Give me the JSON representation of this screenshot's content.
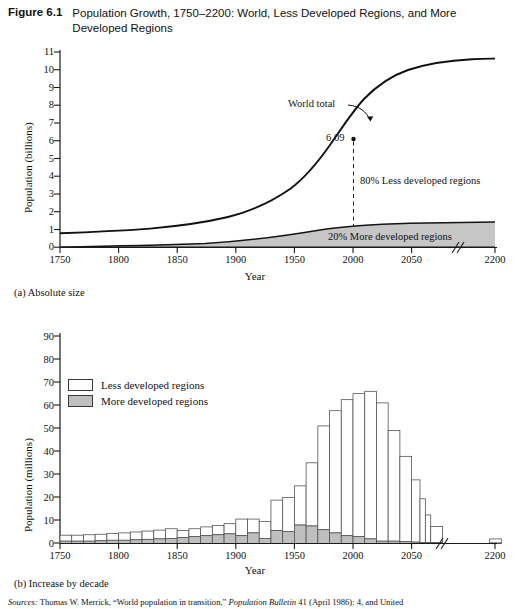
{
  "figure": {
    "number": "Figure 6.1",
    "title": "Population Growth, 1750–2200: World, Less Developed Regions, and More Developed Regions"
  },
  "panel_a": {
    "caption": "(a) Absolute size",
    "ylabel": "Population (billions)",
    "xlabel": "Year",
    "annotations": {
      "world_total": "World total",
      "value_label": "6.09",
      "less_developed": "80% Less developed regions",
      "more_developed": "20% More developed regions"
    }
  },
  "panel_b": {
    "caption": "(b) Increase by decade",
    "ylabel": "Population (millions)",
    "xlabel": "Year",
    "legend": [
      {
        "key": "less",
        "label": "Less developed regions",
        "color": "#ffffff"
      },
      {
        "key": "more",
        "label": "More developed regions",
        "color": "#bfbfbf"
      }
    ]
  },
  "sources": {
    "label": "Sources:",
    "text": " Thomas W. Merrick, “World population in transition,” ",
    "italic": "Population Bulletin",
    "text2": " 41 (April 1986): 4, and United"
  },
  "chart_data": [
    {
      "type": "area",
      "id": "panel-a",
      "title": "(a) Absolute size",
      "xlabel": "Year",
      "ylabel": "Population (billions)",
      "xlim": [
        1750,
        2200
      ],
      "ylim": [
        0,
        11
      ],
      "yticks": [
        0,
        1,
        2,
        3,
        4,
        5,
        6,
        7,
        8,
        9,
        10,
        11
      ],
      "xticks": [
        1750,
        1800,
        1850,
        1900,
        1950,
        2000,
        2050,
        2200
      ],
      "axis_break_between": [
        2050,
        2200
      ],
      "grid": false,
      "legend_position": "none",
      "annotations": [
        {
          "text": "World total",
          "x": 1985,
          "y": 8.0,
          "arrow_to": {
            "x": 2012,
            "y": 7.2
          }
        },
        {
          "text": "6.09",
          "x": 1995,
          "y": 6.09,
          "marker": true
        },
        {
          "text": "80% Less developed regions",
          "x": 2005,
          "y": 3.6
        },
        {
          "text": "20% More developed regions",
          "x": 2035,
          "y": 0.55
        }
      ],
      "series": [
        {
          "name": "World total",
          "x": [
            1750,
            1800,
            1850,
            1900,
            1950,
            1975,
            2000,
            2025,
            2050,
            2075,
            2100,
            2150,
            2200
          ],
          "values": [
            0.79,
            0.98,
            1.26,
            1.65,
            2.52,
            4.08,
            6.09,
            7.9,
            9.1,
            9.7,
            9.95,
            10.1,
            10.15
          ]
        },
        {
          "name": "More developed regions",
          "x": [
            1750,
            1800,
            1850,
            1900,
            1950,
            1975,
            2000,
            2025,
            2050,
            2075,
            2100,
            2150,
            2200
          ],
          "values": [
            0.19,
            0.22,
            0.28,
            0.4,
            0.81,
            1.05,
            1.19,
            1.26,
            1.28,
            1.29,
            1.3,
            1.3,
            1.3
          ]
        }
      ]
    },
    {
      "type": "bar",
      "id": "panel-b",
      "title": "(b) Increase by decade",
      "xlabel": "Year",
      "ylabel": "Population (millions)",
      "stacked": true,
      "xlim": [
        1750,
        2200
      ],
      "ylim": [
        0,
        92
      ],
      "yticks": [
        0,
        10,
        20,
        30,
        40,
        50,
        60,
        70,
        80,
        90
      ],
      "xticks": [
        1750,
        1800,
        1850,
        1900,
        1950,
        2000,
        2050,
        2200
      ],
      "axis_break_between": [
        2050,
        2200
      ],
      "grid": false,
      "legend_position": "upper-left",
      "categories": [
        1750,
        1760,
        1770,
        1780,
        1790,
        1800,
        1810,
        1820,
        1830,
        1840,
        1850,
        1860,
        1870,
        1880,
        1890,
        1900,
        1910,
        1920,
        1930,
        1940,
        1950,
        1960,
        1970,
        1980,
        1990,
        2000,
        2010,
        2020,
        2030,
        2040,
        2050,
        2060,
        2070,
        2080,
        2190
      ],
      "series": [
        {
          "name": "More developed regions",
          "color": "#bfbfbf",
          "values": [
            1.0,
            1.0,
            1.0,
            1.2,
            1.4,
            1.4,
            1.6,
            1.8,
            2.0,
            2.2,
            2.6,
            3.0,
            3.4,
            3.8,
            4.2,
            3.4,
            4.6,
            2.2,
            5.6,
            5.2,
            8.0,
            7.6,
            6.0,
            4.6,
            3.4,
            3.0,
            2.0,
            1.0,
            1.0,
            0.8,
            0.6,
            0.4,
            0.4,
            0.4,
            0.2
          ]
        },
        {
          "name": "Less developed regions",
          "color": "#ffffff",
          "values": [
            2.6,
            2.6,
            2.8,
            2.8,
            3.0,
            3.2,
            3.4,
            3.6,
            3.8,
            4.2,
            3.0,
            3.4,
            3.8,
            4.0,
            4.4,
            7.2,
            6.0,
            7.4,
            13.2,
            14.8,
            17.0,
            27.4,
            45.0,
            53.0,
            59.0,
            62.0,
            64.0,
            60.0,
            48.0,
            37.0,
            27.0,
            19.0,
            12.0,
            7.0,
            1.8
          ]
        }
      ]
    }
  ]
}
